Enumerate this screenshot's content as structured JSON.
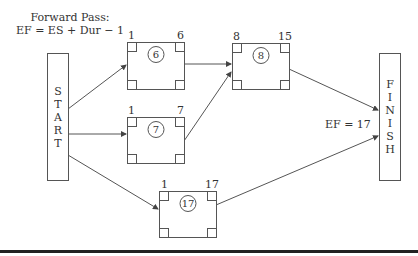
{
  "title": {
    "line1": "Forward Pass:",
    "line2": "EF = ES + Dur − 1"
  },
  "start": {
    "letters": [
      "S",
      "T",
      "A",
      "R",
      "T"
    ]
  },
  "finish": {
    "letters": [
      "F",
      "I",
      "N",
      "I",
      "S",
      "H"
    ]
  },
  "nodes": [
    {
      "id": "6",
      "es": "1",
      "ef": "6"
    },
    {
      "id": "7",
      "es": "1",
      "ef": "7"
    },
    {
      "id": "8",
      "es": "8",
      "ef": "15"
    },
    {
      "id": "17",
      "es": "1",
      "ef": "17"
    }
  ],
  "project_ef": "EF = 17",
  "colors": {
    "line": "#555555",
    "text": "#333333",
    "rule": "#222222"
  }
}
